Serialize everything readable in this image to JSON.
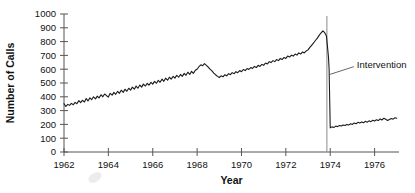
{
  "chart_data": {
    "type": "line",
    "title": "",
    "xlabel": "Year",
    "ylabel": "Number of Calls",
    "xlim": [
      1962,
      1977.1
    ],
    "ylim": [
      0,
      1000
    ],
    "grid": false,
    "legend": "none",
    "xticks": [
      1962,
      1964,
      1966,
      1968,
      1970,
      1972,
      1974,
      1976
    ],
    "xtick_labels": [
      "1962",
      "1964",
      "1966",
      "1968",
      "1970",
      "1972",
      "1974",
      "1976"
    ],
    "yticks": [
      0,
      100,
      200,
      300,
      400,
      500,
      600,
      700,
      800,
      900,
      1000
    ],
    "ytick_labels": [
      "0",
      "100",
      "200",
      "300",
      "400",
      "500",
      "600",
      "700",
      "800",
      "900",
      "1000"
    ],
    "line_color": "#1a1a1a",
    "annotations": [
      {
        "name": "intervention",
        "label": "Intervention",
        "x": 1973.85,
        "type": "vline",
        "color": "#8a8a8a",
        "label_x": 1975.2,
        "label_y": 640
      }
    ],
    "series": [
      {
        "name": "Number of Calls",
        "x": [
          1962.0,
          1962.08,
          1962.17,
          1962.25,
          1962.33,
          1962.42,
          1962.5,
          1962.58,
          1962.67,
          1962.75,
          1962.83,
          1962.92,
          1963.0,
          1963.08,
          1963.17,
          1963.25,
          1963.33,
          1963.42,
          1963.5,
          1963.58,
          1963.67,
          1963.75,
          1963.83,
          1963.92,
          1964.0,
          1964.08,
          1964.17,
          1964.25,
          1964.33,
          1964.42,
          1964.5,
          1964.58,
          1964.67,
          1964.75,
          1964.83,
          1964.92,
          1965.0,
          1965.08,
          1965.17,
          1965.25,
          1965.33,
          1965.42,
          1965.5,
          1965.58,
          1965.67,
          1965.75,
          1965.83,
          1965.92,
          1966.0,
          1966.08,
          1966.17,
          1966.25,
          1966.33,
          1966.42,
          1966.5,
          1966.58,
          1966.67,
          1966.75,
          1966.83,
          1966.92,
          1967.0,
          1967.08,
          1967.17,
          1967.25,
          1967.33,
          1967.42,
          1967.5,
          1967.58,
          1967.67,
          1967.75,
          1967.83,
          1967.92,
          1968.0,
          1968.08,
          1968.17,
          1968.25,
          1968.33,
          1968.42,
          1968.5,
          1968.58,
          1968.67,
          1968.75,
          1968.83,
          1968.92,
          1969.0,
          1969.08,
          1969.17,
          1969.25,
          1969.33,
          1969.42,
          1969.5,
          1969.58,
          1969.67,
          1969.75,
          1969.83,
          1969.92,
          1970.0,
          1970.08,
          1970.17,
          1970.25,
          1970.33,
          1970.42,
          1970.5,
          1970.58,
          1970.67,
          1970.75,
          1970.83,
          1970.92,
          1971.0,
          1971.08,
          1971.17,
          1971.25,
          1971.33,
          1971.42,
          1971.5,
          1971.58,
          1971.67,
          1971.75,
          1971.83,
          1971.92,
          1972.0,
          1972.08,
          1972.17,
          1972.25,
          1972.33,
          1972.42,
          1972.5,
          1972.58,
          1972.67,
          1972.75,
          1972.83,
          1972.92,
          1973.0,
          1973.08,
          1973.17,
          1973.25,
          1973.33,
          1973.42,
          1973.5,
          1973.58,
          1973.67,
          1973.75,
          1973.83,
          1973.92,
          1973.95,
          1974.0,
          1974.08,
          1974.17,
          1974.25,
          1974.33,
          1974.42,
          1974.5,
          1974.58,
          1974.67,
          1974.75,
          1974.83,
          1974.92,
          1975.0,
          1975.08,
          1975.17,
          1975.25,
          1975.33,
          1975.42,
          1975.5,
          1975.58,
          1975.67,
          1975.75,
          1975.83,
          1975.92,
          1976.0,
          1976.08,
          1976.17,
          1976.25,
          1976.33,
          1976.42,
          1976.5,
          1976.58,
          1976.67,
          1976.75,
          1976.83,
          1976.92,
          1977.0
        ],
        "y": [
          350,
          330,
          345,
          338,
          352,
          342,
          360,
          350,
          372,
          358,
          375,
          362,
          388,
          370,
          392,
          380,
          400,
          385,
          405,
          392,
          415,
          400,
          420,
          408,
          398,
          425,
          412,
          432,
          418,
          440,
          425,
          448,
          432,
          455,
          440,
          462,
          448,
          470,
          455,
          478,
          462,
          485,
          470,
          492,
          478,
          498,
          485,
          505,
          492,
          512,
          498,
          520,
          505,
          528,
          512,
          535,
          520,
          542,
          528,
          548,
          535,
          555,
          542,
          562,
          548,
          570,
          556,
          578,
          562,
          585,
          570,
          592,
          600,
          618,
          632,
          625,
          640,
          628,
          615,
          600,
          588,
          572,
          560,
          548,
          540,
          552,
          545,
          560,
          552,
          568,
          560,
          575,
          568,
          582,
          575,
          590,
          582,
          598,
          590,
          605,
          598,
          612,
          605,
          620,
          612,
          628,
          620,
          635,
          628,
          645,
          638,
          655,
          648,
          662,
          655,
          670,
          662,
          678,
          670,
          685,
          678,
          695,
          688,
          702,
          695,
          710,
          702,
          718,
          710,
          725,
          718,
          732,
          740,
          758,
          775,
          790,
          808,
          825,
          845,
          862,
          878,
          865,
          840,
          690,
          600,
          175,
          182,
          178,
          188,
          184,
          192,
          188,
          196,
          192,
          200,
          195,
          205,
          200,
          210,
          205,
          215,
          210,
          218,
          212,
          222,
          216,
          226,
          220,
          230,
          224,
          234,
          228,
          240,
          232,
          245,
          238,
          228,
          235,
          242,
          238,
          248,
          245
        ]
      }
    ]
  }
}
